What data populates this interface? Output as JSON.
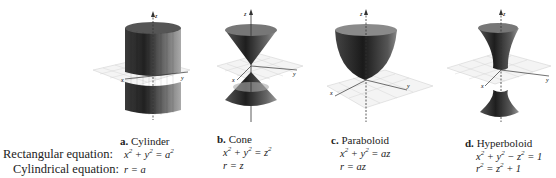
{
  "row_labels": {
    "rectangular": "Rectangular equation:",
    "cylindrical": "Cylindrical equation:"
  },
  "surfaces": [
    {
      "letter": "a.",
      "name": "Cylinder",
      "rect": {
        "lhs": "x",
        "p1": "2",
        "mid": " + y",
        "p2": "2",
        "rest": " = a",
        "p3": "2",
        "tail": ""
      },
      "cyl": {
        "a": "r = a",
        "p": "",
        "b": ""
      }
    },
    {
      "letter": "b.",
      "name": "Cone",
      "rect": {
        "lhs": "x",
        "p1": "2",
        "mid": " + y",
        "p2": "2",
        "rest": " = z",
        "p3": "2",
        "tail": ""
      },
      "cyl": {
        "a": "r = z",
        "p": "",
        "b": ""
      }
    },
    {
      "letter": "c.",
      "name": "Paraboloid",
      "rect": {
        "lhs": "x",
        "p1": "2",
        "mid": " + y",
        "p2": "2",
        "rest": " = az",
        "p3": "",
        "tail": ""
      },
      "cyl": {
        "a": "r = az",
        "p": "",
        "b": ""
      }
    },
    {
      "letter": "d.",
      "name": "Hyperboloid",
      "rect": {
        "lhs": "x",
        "p1": "2",
        "mid": " + y",
        "p2": "2",
        "rest": " − z",
        "p3": "2",
        "tail": " = 1"
      },
      "cyl": {
        "a": "r",
        "p": "2",
        "b": " = z",
        "p2": "2",
        "c": " + 1"
      }
    }
  ],
  "axis_labels": {
    "x": "x",
    "y": "y",
    "z": "z"
  },
  "colors": {
    "surface_dark": "#2a2a2a",
    "surface_light": "#8a8a8a",
    "grid": "#c8c8c8",
    "axis": "#333333"
  }
}
